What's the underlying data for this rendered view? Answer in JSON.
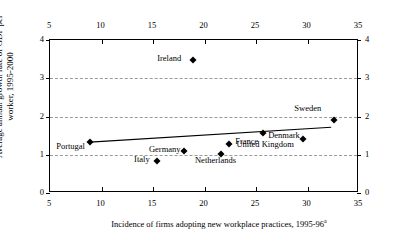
{
  "chart_data": {
    "type": "scatter",
    "title": "",
    "subtitle": "",
    "xlabel": "Incidence of firms adopting new workplace practices, 1995-96",
    "xlabel_superscript": "a",
    "ylabel_line1": "Average annual growth rate of GDP per",
    "ylabel_line2": "worker, 1995-2000",
    "xlim": [
      5,
      35
    ],
    "ylim": [
      0,
      4
    ],
    "xticks": [
      5,
      10,
      15,
      20,
      25,
      30,
      35
    ],
    "yticks": [
      0,
      1,
      2,
      3,
      4
    ],
    "xtick_labels": [
      "5",
      "10",
      "15",
      "20",
      "25",
      "30",
      "35"
    ],
    "ytick_labels": [
      "0",
      "1",
      "2",
      "3",
      "4"
    ],
    "x_axis_top": true,
    "x_axis_bottom": true,
    "y_axis_left": true,
    "y_axis_right": true,
    "grid": "horizontal-dashed",
    "grid_color": "#9a9a9a",
    "marker_color": "#000000",
    "marker_shape": "diamond",
    "legend": "none",
    "points": [
      {
        "name": "Portugal",
        "x": 8.9,
        "y": 1.33,
        "label_dx": -34,
        "label_dy": 9
      },
      {
        "name": "Italy",
        "x": 15.4,
        "y": 0.83,
        "label_dx": -23,
        "label_dy": 3
      },
      {
        "name": "Germany",
        "x": 18.0,
        "y": 1.1,
        "label_dx": -35,
        "label_dy": 3
      },
      {
        "name": "Ireland",
        "x": 18.9,
        "y": 3.47,
        "label_dx": -36,
        "label_dy": 3
      },
      {
        "name": "Netherlands",
        "x": 21.6,
        "y": 1.03,
        "label_dx": -26,
        "label_dy": 11
      },
      {
        "name": "France",
        "x": 22.4,
        "y": 1.27,
        "label_dx": 6,
        "label_dy": 2
      },
      {
        "name": "Denmark",
        "x": 25.7,
        "y": 1.56,
        "label_dx": 5,
        "label_dy": 7
      },
      {
        "name": "United Kingdom",
        "x": 29.6,
        "y": 1.4,
        "label_dx": -67,
        "label_dy": 10
      },
      {
        "name": "Sweden",
        "x": 32.6,
        "y": 1.9,
        "label_dx": -40,
        "label_dy": -7
      }
    ],
    "trendline": {
      "present": true,
      "color": "#000000",
      "x_start": 8.9,
      "y_start": 1.33,
      "x_end": 32.3,
      "y_end": 1.72
    }
  }
}
